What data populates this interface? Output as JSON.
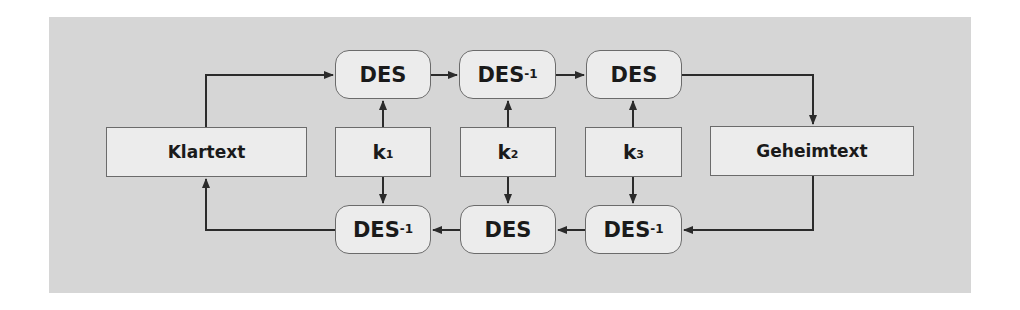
{
  "diagram": {
    "colors": {
      "background": "#d6d6d6",
      "box_fill": "#ececec",
      "box_border": "#6b6b6b",
      "line": "#2b2b2b",
      "text": "#1a1a1a"
    },
    "plaintext": {
      "label": "Klartext"
    },
    "ciphertext": {
      "label": "Geheimtext"
    },
    "keys": [
      {
        "base": "k",
        "sub": "1"
      },
      {
        "base": "k",
        "sub": "2"
      },
      {
        "base": "k",
        "sub": "3"
      }
    ],
    "encrypt_row": [
      {
        "base": "DES",
        "sup": ""
      },
      {
        "base": "DES",
        "sup": "-1"
      },
      {
        "base": "DES",
        "sup": ""
      }
    ],
    "decrypt_row": [
      {
        "base": "DES",
        "sup": "-1"
      },
      {
        "base": "DES",
        "sup": ""
      },
      {
        "base": "DES",
        "sup": "-1"
      }
    ]
  }
}
